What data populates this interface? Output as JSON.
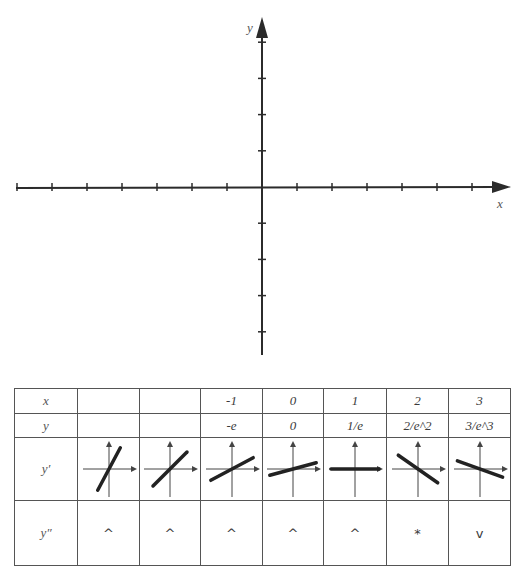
{
  "graph": {
    "x_axis_label": "x",
    "y_axis_label": "y",
    "origin_px": [
      262,
      187
    ],
    "tick_spacing_px": 35,
    "x_ticks_left": 7,
    "x_ticks_right": 6,
    "y_ticks_up": 4,
    "y_ticks_down": 4
  },
  "table": {
    "row_labels": {
      "x": "x",
      "y": "y",
      "y_prime": "y′",
      "y_double_prime": "y″"
    },
    "columns": [
      {
        "x": "",
        "y": "",
        "slope_deg": 62,
        "concavity": "^"
      },
      {
        "x": "",
        "y": "",
        "slope_deg": 45,
        "concavity": "^"
      },
      {
        "x": "-1",
        "y": "-e",
        "slope_deg": 28,
        "concavity": "^"
      },
      {
        "x": "0",
        "y": "0",
        "slope_deg": 15,
        "concavity": "^"
      },
      {
        "x": "1",
        "y": "1/e",
        "slope_deg": 0,
        "concavity": "^"
      },
      {
        "x": "2",
        "y": "2/e^2",
        "slope_deg": -35,
        "concavity": "*"
      },
      {
        "x": "3",
        "y": "3/e^3",
        "slope_deg": -20,
        "concavity": "v"
      }
    ]
  }
}
